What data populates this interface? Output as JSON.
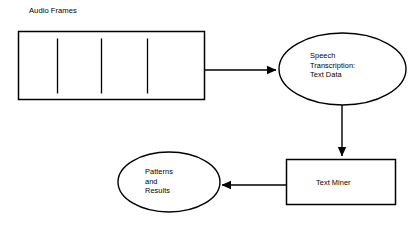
{
  "diagram": {
    "background_color": "#ffffff",
    "stroke_color": "#000000",
    "nodes": {
      "audio_frames": {
        "label": "Audio Frames",
        "shape": "rectangle-with-frame-ticks",
        "tick_count": 3,
        "fill": "#ffffff"
      },
      "speech_transcription": {
        "label": "Speech\nTranscription:\nText Data",
        "line_1": "Speech",
        "line_2": "Transcription:",
        "line_3": "Text Data",
        "shape": "ellipse",
        "fill": "#ffffff"
      },
      "text_miner": {
        "label": "Text Miner",
        "shape": "rectangle",
        "fill": "#ffffff"
      },
      "patterns_results": {
        "label": "Patterns\nand\nResults",
        "line_1": "Patterns",
        "line_2": "and",
        "line_3": "Results",
        "shape": "ellipse",
        "fill": "#ffffff"
      }
    },
    "edges": [
      {
        "name": "audio-frames-to-speech",
        "from": "audio_frames",
        "to": "speech_transcription",
        "direction": "right",
        "label": ""
      },
      {
        "name": "speech-to-text-miner",
        "from": "speech_transcription",
        "to": "text_miner",
        "direction": "down",
        "label": ""
      },
      {
        "name": "text-miner-to-patterns",
        "from": "text_miner",
        "to": "patterns_results",
        "direction": "left",
        "label": ""
      }
    ]
  }
}
